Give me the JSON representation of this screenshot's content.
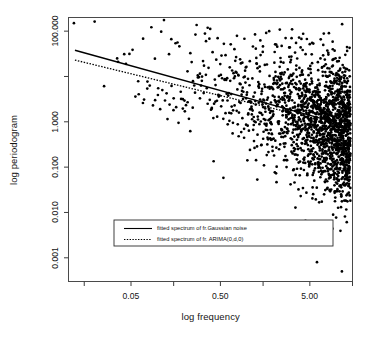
{
  "figure": {
    "width": 378,
    "height": 349,
    "background": "#ffffff",
    "foreground": "#000000"
  },
  "chart_data": {
    "type": "scatter",
    "title": "",
    "xlabel": "log frequency",
    "ylabel": "log periodogram",
    "x_scale": "log",
    "y_scale": "log",
    "grid": false,
    "xlim": [
      0.01,
      15.0
    ],
    "ylim": [
      0.0003,
      200.0
    ],
    "xtick_values": [
      0.005,
      0.05,
      0.5,
      5.0
    ],
    "xtick_labels": [
      "",
      "0.05",
      "0.50",
      "5.00"
    ],
    "xtick_minor_values": [
      0.015,
      0.15,
      1.5,
      15.0
    ],
    "ytick_values": [
      0.001,
      0.01,
      0.1,
      1.0,
      10.0,
      100.0
    ],
    "ytick_labels": [
      "0.001",
      "0.010",
      "0.100",
      "1.000",
      "",
      "100.000"
    ],
    "marker": "filled-circle",
    "marker_color": "#000000",
    "marker_size": 2.0,
    "legend": {
      "position": "lower-center",
      "border": true,
      "entries": [
        {
          "label": "fitted spectrum of fr.Gaussian noise",
          "style": "solid"
        },
        {
          "label": "fitted spectrum of fr. ARIMA(0,d,0)",
          "style": "dotted"
        }
      ]
    },
    "series": [
      {
        "name": "periodogram",
        "marker": "filled-circle",
        "points_note": "log-log scatter of periodogram ordinates vs frequency; dense cloud widening toward high frequency",
        "points": [
          [
            0.0115,
            150.0
          ],
          [
            0.025,
            6.1
          ],
          [
            0.035,
            25.0
          ],
          [
            0.042,
            31.0
          ],
          [
            0.048,
            31.5
          ],
          [
            0.056,
            3.6
          ],
          [
            0.061,
            4.05
          ],
          [
            0.068,
            2.6
          ],
          [
            0.07,
            3.1
          ],
          [
            0.076,
            5.4
          ],
          [
            0.081,
            6.3
          ],
          [
            0.088,
            2.3
          ],
          [
            0.093,
            3.0
          ],
          [
            0.1,
            3.9
          ],
          [
            0.106,
            1.9
          ],
          [
            0.112,
            5.0
          ],
          [
            0.12,
            2.95
          ],
          [
            0.128,
            1.15
          ],
          [
            0.135,
            2.4
          ],
          [
            0.142,
            6.2
          ],
          [
            0.15,
            3.3
          ],
          [
            0.16,
            2.1
          ],
          [
            0.17,
            0.95
          ],
          [
            0.18,
            4.6
          ],
          [
            0.19,
            3.15
          ],
          [
            0.2,
            1.7
          ],
          [
            0.215,
            2.7
          ],
          [
            0.23,
            0.62
          ],
          [
            0.245,
            2.05
          ],
          [
            0.26,
            4.4
          ],
          [
            0.28,
            9.5
          ],
          [
            0.295,
            11.5
          ],
          [
            0.31,
            8.0
          ],
          [
            0.325,
            4.3
          ],
          [
            0.345,
            60.0
          ],
          [
            0.36,
            2.5
          ],
          [
            0.38,
            3.05
          ],
          [
            0.4,
            1.95
          ],
          [
            0.42,
            0.135
          ],
          [
            0.44,
            2.8
          ],
          [
            0.46,
            1.3
          ],
          [
            0.48,
            3.6
          ],
          [
            0.51,
            2.2
          ],
          [
            0.54,
            0.058
          ],
          [
            0.57,
            1.55
          ],
          [
            0.6,
            2.95
          ],
          [
            0.63,
            1.05
          ],
          [
            0.66,
            4.1
          ],
          [
            0.69,
            0.95
          ],
          [
            0.72,
            2.3
          ],
          [
            0.76,
            1.75
          ],
          [
            0.8,
            0.48
          ],
          [
            0.84,
            2.6
          ],
          [
            0.88,
            1.2
          ],
          [
            0.92,
            0.7
          ],
          [
            0.97,
            3.3
          ],
          [
            1.02,
            1.45
          ],
          [
            1.07,
            0.24
          ],
          [
            1.12,
            1.9
          ],
          [
            1.18,
            0.85
          ],
          [
            1.24,
            2.4
          ],
          [
            1.3,
            0.52
          ],
          [
            1.37,
            1.6
          ],
          [
            1.44,
            0.31
          ],
          [
            1.51,
            2.1
          ],
          [
            1.59,
            1.1
          ],
          [
            1.67,
            0.66
          ],
          [
            1.75,
            1.85
          ],
          [
            1.84,
            0.4
          ],
          [
            1.93,
            1.35
          ],
          [
            2.03,
            0.077
          ],
          [
            2.13,
            2.2
          ],
          [
            2.24,
            0.9
          ],
          [
            2.35,
            0.55
          ],
          [
            2.47,
            1.7
          ],
          [
            2.6,
            0.28
          ],
          [
            2.73,
            1.25
          ],
          [
            2.87,
            0.62
          ],
          [
            3.01,
            1.95
          ],
          [
            3.16,
            0.41
          ],
          [
            3.32,
            1.1
          ],
          [
            3.49,
            0.19
          ],
          [
            3.67,
            1.55
          ],
          [
            3.85,
            0.75
          ],
          [
            4.05,
            0.34
          ],
          [
            4.25,
            1.4
          ],
          [
            4.47,
            0.0065
          ],
          [
            4.7,
            0.88
          ],
          [
            4.93,
            0.47
          ],
          [
            5.18,
            1.7
          ],
          [
            5.45,
            0.26
          ],
          [
            5.72,
            1.15
          ],
          [
            6.01,
            0.0008
          ],
          [
            6.32,
            0.6
          ],
          [
            6.64,
            1.3
          ],
          [
            6.97,
            0.36
          ],
          [
            7.33,
            0.95
          ],
          [
            7.7,
            0.22
          ],
          [
            8.09,
            1.45
          ],
          [
            8.5,
            0.52
          ],
          [
            8.93,
            0.0044
          ],
          [
            9.38,
            0.8
          ],
          [
            9.86,
            0.3
          ],
          [
            10.35,
            1.2
          ],
          [
            10.87,
            0.45
          ],
          [
            11.42,
            0.0005
          ],
          [
            11.99,
            0.68
          ],
          [
            12.6,
            0.17
          ],
          [
            13.23,
            1.0
          ],
          [
            13.9,
            0.38
          ]
        ]
      }
    ],
    "fits": [
      {
        "name": "fitted spectrum of fr.Gaussian noise",
        "style": "solid",
        "endpoints": [
          [
            0.0118,
            38.0
          ],
          [
            8.4,
            1.05
          ]
        ]
      },
      {
        "name": "fitted spectrum of fr. ARIMA(0,d,0)",
        "style": "dotted",
        "endpoints": [
          [
            0.0118,
            23.0
          ],
          [
            3.2,
            1.55
          ]
        ]
      }
    ]
  }
}
